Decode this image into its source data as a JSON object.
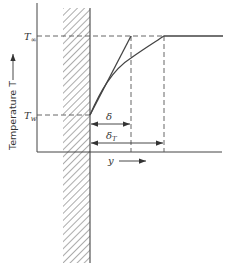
{
  "diagram": {
    "type": "boundary-layer-temperature-profile",
    "y_axis_label": "Temperature T",
    "x_axis_label": "y",
    "levels": {
      "T_inf": {
        "label": "T",
        "subscript": "∞"
      },
      "T_w": {
        "label": "T",
        "subscript": "w"
      }
    },
    "dimensions": {
      "delta": {
        "label": "δ"
      },
      "delta_T": {
        "label": "δ",
        "subscript": "T"
      }
    },
    "wall": {
      "hatched": true
    },
    "curves": [
      {
        "name": "linear approximation",
        "style": "solid"
      },
      {
        "name": "actual temperature profile",
        "style": "solid"
      }
    ],
    "colors": {
      "line": "#444444",
      "dashed": "#555555",
      "hatch": "#666666"
    }
  }
}
